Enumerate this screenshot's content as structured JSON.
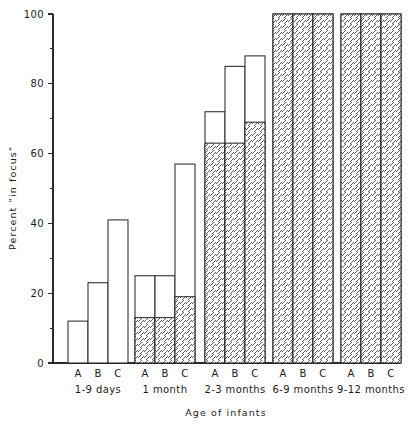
{
  "chart_data": {
    "type": "bar",
    "title": "",
    "subtitle": "",
    "xlabel": "Age of infants",
    "ylabel": "Percent \"in focus\"",
    "ylim": [
      0,
      100
    ],
    "xlim_note": "5 age groups, 3 bars each (A, B, C)",
    "grid": false,
    "legend_position": "none",
    "y_major_ticks": [
      0,
      20,
      40,
      60,
      80,
      100
    ],
    "y_minor_ticks": [
      10,
      30,
      50,
      70,
      90
    ],
    "y_tick_labels": [
      "0",
      "20",
      "40",
      "60",
      "80",
      "100"
    ],
    "categories": [
      "1-9 days",
      "1 month",
      "2-3 months",
      "6-9 months",
      "9-12 months"
    ],
    "bar_letters": [
      "A",
      "B",
      "C"
    ],
    "series": [
      {
        "name": "hatched-portion",
        "style": "diagonal-hatch",
        "values": [
          [
            0,
            0,
            0
          ],
          [
            13,
            13,
            19
          ],
          [
            63,
            63,
            69
          ],
          [
            100,
            100,
            100
          ],
          [
            100,
            100,
            100
          ]
        ]
      },
      {
        "name": "total",
        "style": "open-outline",
        "values": [
          [
            12,
            23,
            41
          ],
          [
            25,
            25,
            57
          ],
          [
            72,
            85,
            88
          ],
          [
            100,
            100,
            100
          ],
          [
            100,
            100,
            100
          ]
        ]
      }
    ],
    "groups": [
      {
        "label": "1-9 days",
        "bars": [
          {
            "letter": "A",
            "total": 12,
            "hatched": 0
          },
          {
            "letter": "B",
            "total": 23,
            "hatched": 0
          },
          {
            "letter": "C",
            "total": 41,
            "hatched": 0
          }
        ]
      },
      {
        "label": "1 month",
        "bars": [
          {
            "letter": "A",
            "total": 25,
            "hatched": 13
          },
          {
            "letter": "B",
            "total": 25,
            "hatched": 13
          },
          {
            "letter": "C",
            "total": 57,
            "hatched": 19
          }
        ]
      },
      {
        "label": "2-3 months",
        "bars": [
          {
            "letter": "A",
            "total": 72,
            "hatched": 63
          },
          {
            "letter": "B",
            "total": 85,
            "hatched": 63
          },
          {
            "letter": "C",
            "total": 88,
            "hatched": 69
          }
        ]
      },
      {
        "label": "6-9 months",
        "bars": [
          {
            "letter": "A",
            "total": 100,
            "hatched": 100
          },
          {
            "letter": "B",
            "total": 100,
            "hatched": 100
          },
          {
            "letter": "C",
            "total": 100,
            "hatched": 100
          }
        ]
      },
      {
        "label": "9-12 months",
        "bars": [
          {
            "letter": "A",
            "total": 100,
            "hatched": 100
          },
          {
            "letter": "B",
            "total": 100,
            "hatched": 100
          },
          {
            "letter": "C",
            "total": 100,
            "hatched": 100
          }
        ]
      }
    ],
    "colors": {
      "ink": "#2b2b2b",
      "background": "#ffffff",
      "hatch": "#4a4a4a"
    }
  },
  "layout": {
    "plot_left": 53,
    "plot_right": 400,
    "plot_top": 14,
    "plot_bottom": 363,
    "bar_width": 20,
    "group_starts": [
      68,
      135,
      205,
      273,
      341
    ]
  }
}
